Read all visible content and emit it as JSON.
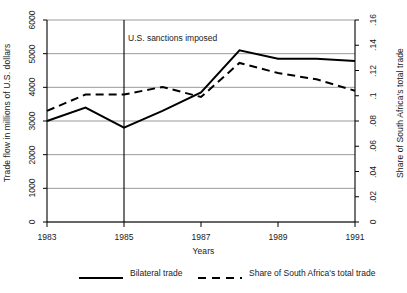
{
  "chart_data": {
    "type": "line",
    "title": "",
    "xlabel": "Years",
    "ylabel": "Trade flow in millions of U.S. dollars",
    "ylabel_right": "Share of South Africa's total trade",
    "x": [
      1983,
      1984,
      1985,
      1986,
      1987,
      1988,
      1989,
      1990,
      1991
    ],
    "xlim": [
      1983,
      1991
    ],
    "ylim": [
      0,
      6000
    ],
    "ylim_right": [
      0,
      0.16
    ],
    "xticks": [
      "1983",
      "1985",
      "1987",
      "1989",
      "1991"
    ],
    "xtick_values": [
      1983,
      1985,
      1987,
      1989,
      1991
    ],
    "yticks_left": [
      "0",
      "1000",
      "2000",
      "3000",
      "4000",
      "5000",
      "6000"
    ],
    "ytick_left_values": [
      0,
      1000,
      2000,
      3000,
      4000,
      5000,
      6000
    ],
    "yticks_right": [
      "0",
      ".02",
      ".04",
      ".06",
      ".08",
      ".1",
      ".12",
      ".14",
      ".16"
    ],
    "ytick_right_values": [
      0,
      0.02,
      0.04,
      0.06,
      0.08,
      0.1,
      0.12,
      0.14,
      0.16
    ],
    "grid": true,
    "grid_axis": "y",
    "legend_position": "bottom",
    "series": [
      {
        "name": "Bilateral trade",
        "axis": "left",
        "style": "solid",
        "color": "#000000",
        "values": [
          3000,
          3400,
          2800,
          3300,
          3850,
          5100,
          4850,
          4850,
          4780
        ]
      },
      {
        "name": "Share of South Africa's total trade",
        "axis": "right",
        "style": "dashed",
        "color": "#000000",
        "values": [
          0.088,
          0.101,
          0.101,
          0.107,
          0.099,
          0.126,
          0.118,
          0.113,
          0.104
        ]
      }
    ],
    "annotations": [
      {
        "text": "U.S. sanctions imposed",
        "x": 1985,
        "type": "vertical-line-label"
      }
    ],
    "vertical_rules": [
      {
        "x": 1985,
        "label": "U.S. sanctions imposed"
      }
    ]
  },
  "legend": {
    "items": [
      {
        "label": "Bilateral trade",
        "style": "solid"
      },
      {
        "label": "Share of South Africa's total trade",
        "style": "dashed"
      }
    ]
  }
}
